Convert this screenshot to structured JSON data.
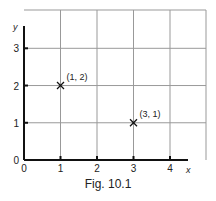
{
  "chart_data": {
    "type": "scatter",
    "title": "",
    "caption": "Fig. 10.1",
    "xlabel": "x",
    "ylabel": "y",
    "xlim": [
      0,
      5
    ],
    "ylim": [
      0,
      4
    ],
    "x_ticks": [
      "0",
      "1",
      "2",
      "3",
      "4"
    ],
    "y_ticks": [
      "0",
      "1",
      "2",
      "3"
    ],
    "grid": true,
    "series": [
      {
        "name": "points",
        "marker": "x",
        "points": [
          {
            "x": 1,
            "y": 2,
            "label": "(1, 2)"
          },
          {
            "x": 3,
            "y": 1,
            "label": "(3, 1)"
          }
        ]
      }
    ]
  },
  "colors": {
    "grid": "#999999",
    "axis": "#111111",
    "text": "#222222"
  }
}
